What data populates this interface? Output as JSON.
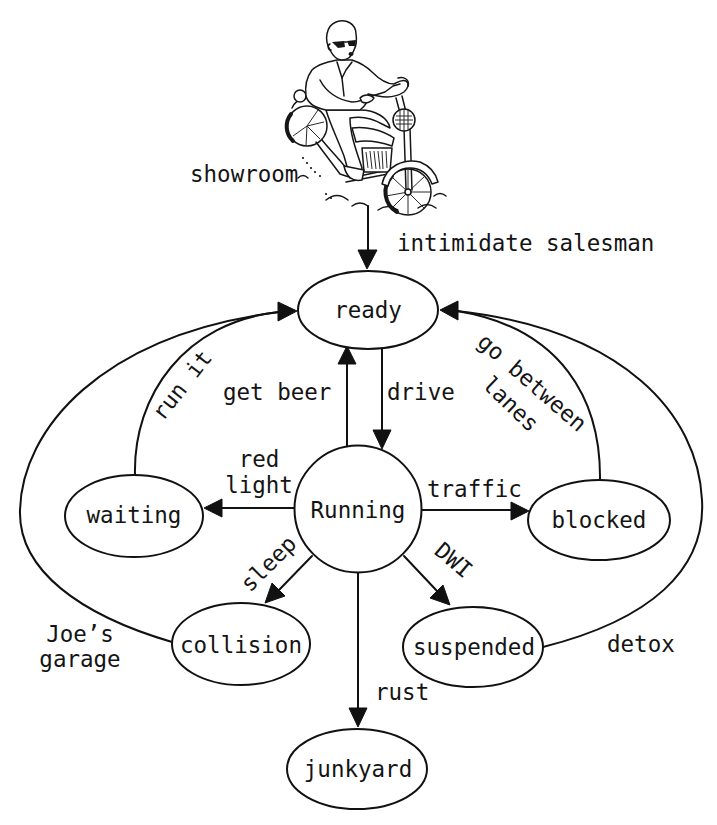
{
  "diagram": {
    "illustration": "biker-on-motorcycle",
    "start_label": "showroom",
    "colors": {
      "ink": "#111111",
      "background": "#ffffff"
    },
    "nodes": {
      "ready": "ready",
      "running": "Running",
      "waiting": "waiting",
      "blocked": "blocked",
      "collision": "collision",
      "suspended": "suspended",
      "junkyard": "junkyard"
    },
    "edges": [
      {
        "from": "showroom",
        "to": "ready",
        "label_lines": [
          "intimidate salesman"
        ]
      },
      {
        "from": "ready",
        "to": "Running",
        "label_lines": [
          "drive"
        ]
      },
      {
        "from": "Running",
        "to": "ready",
        "label_lines": [
          "get beer"
        ]
      },
      {
        "from": "Running",
        "to": "waiting",
        "label_lines": [
          "red",
          "light"
        ]
      },
      {
        "from": "waiting",
        "to": "ready",
        "label_lines": [
          "run it"
        ]
      },
      {
        "from": "Running",
        "to": "blocked",
        "label_lines": [
          "traffic"
        ]
      },
      {
        "from": "blocked",
        "to": "ready",
        "label_lines": [
          "go between",
          "lanes"
        ]
      },
      {
        "from": "Running",
        "to": "collision",
        "label_lines": [
          "sleep"
        ]
      },
      {
        "from": "collision",
        "to": "ready",
        "label_lines": [
          "Joe’s",
          "garage"
        ]
      },
      {
        "from": "Running",
        "to": "suspended",
        "label_lines": [
          "DWI"
        ]
      },
      {
        "from": "suspended",
        "to": "ready",
        "label_lines": [
          "detox"
        ]
      },
      {
        "from": "Running",
        "to": "junkyard",
        "label_lines": [
          "rust"
        ]
      }
    ]
  }
}
